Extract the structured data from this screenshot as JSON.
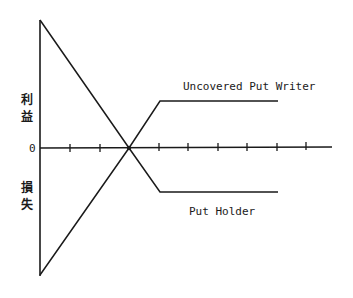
{
  "diagram": {
    "type": "payoff-diagram",
    "y_axis": {
      "positive_label": "利益",
      "negative_label": "損失",
      "zero_label": "0"
    },
    "x_axis": {
      "tick_count": 9
    },
    "series": [
      {
        "name": "Uncovered Put Writer",
        "label": "Uncovered Put Writer",
        "shape": "rises from large loss, crosses zero, then flat profit"
      },
      {
        "name": "Put Holder",
        "label": "Put Holder",
        "shape": "falls from large profit, crosses zero, then flat loss"
      }
    ],
    "colors": {
      "line": "#1a1a1a",
      "background": "#ffffff"
    }
  }
}
